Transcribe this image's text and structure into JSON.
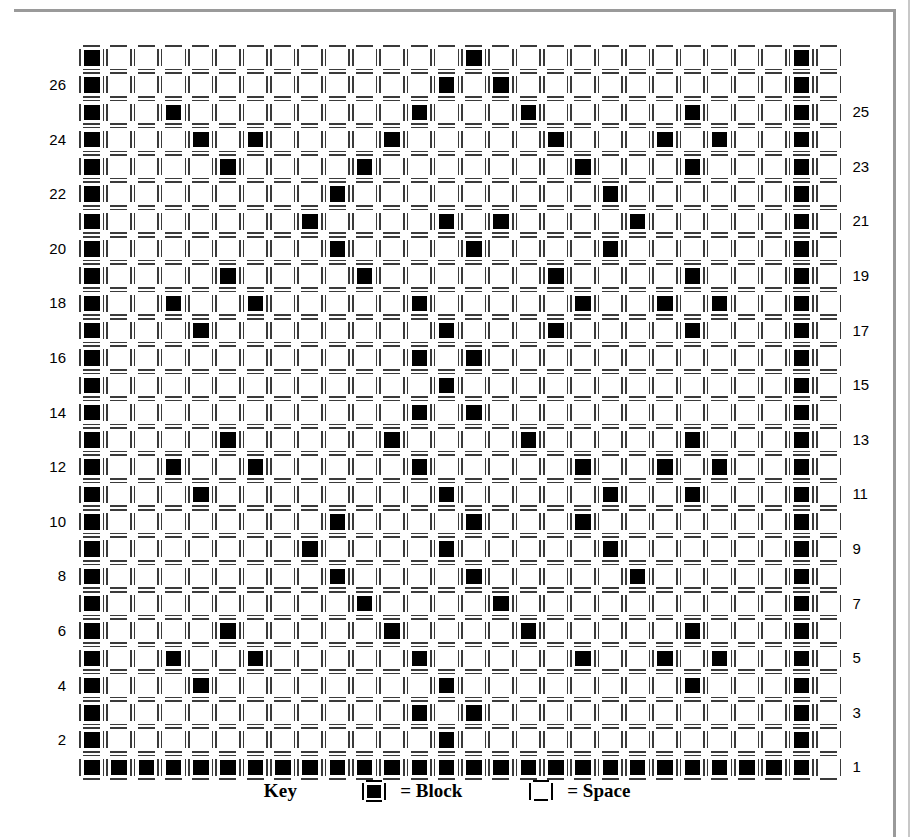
{
  "figure": {
    "type": "block-grid-pattern",
    "rows": 27,
    "cols": 28,
    "cell_glyph_block": "|■|",
    "cell_glyph_space": "|_|"
  },
  "axis": {
    "left_labels": [
      "26",
      "24",
      "22",
      "20",
      "18",
      "16",
      "14",
      "12",
      "10",
      "8",
      "6",
      "4",
      "2"
    ],
    "right_labels": [
      "25",
      "23",
      "21",
      "19",
      "17",
      "15",
      "13",
      "11",
      "9",
      "7",
      "5",
      "3",
      "1"
    ],
    "left_label_rows": [
      26,
      24,
      22,
      20,
      18,
      16,
      14,
      12,
      10,
      8,
      6,
      4,
      2
    ],
    "right_label_rows": [
      25,
      23,
      21,
      19,
      17,
      15,
      13,
      11,
      9,
      7,
      5,
      3,
      1
    ]
  },
  "key": {
    "title": "Key",
    "block_label": "= Block",
    "space_label": "= Space",
    "block_symbol": "block-cell",
    "space_symbol": "space-cell"
  },
  "colors": {
    "block": "#000000",
    "bracket": "#3a3a3a",
    "page_border": "#9a9a9a",
    "background": "#ffffff"
  },
  "chart_data": {
    "type": "heatmap",
    "title": "",
    "xlabel": "",
    "ylabel": "",
    "grid": true,
    "rows": 27,
    "cols": 28,
    "row_order_top_to_bottom": [
      27,
      26,
      25,
      24,
      23,
      22,
      21,
      20,
      19,
      18,
      17,
      16,
      15,
      14,
      13,
      12,
      11,
      10,
      9,
      8,
      7,
      6,
      5,
      4,
      3,
      2,
      1
    ],
    "legend": [
      "Block",
      "Space"
    ],
    "note": "Each matrix row is a list of 28 values: 1 = Block, 0 = Space. Row 1 (bottom) is fully filled.",
    "matrix": [
      [
        1,
        0,
        0,
        0,
        0,
        0,
        0,
        0,
        0,
        0,
        0,
        0,
        0,
        0,
        1,
        0,
        0,
        0,
        0,
        0,
        0,
        0,
        0,
        0,
        0,
        0,
        1,
        0
      ],
      [
        1,
        0,
        0,
        0,
        0,
        0,
        0,
        0,
        0,
        0,
        0,
        0,
        0,
        1,
        0,
        1,
        0,
        0,
        0,
        0,
        0,
        0,
        0,
        0,
        0,
        0,
        1,
        0
      ],
      [
        1,
        0,
        0,
        1,
        0,
        0,
        0,
        0,
        0,
        0,
        0,
        0,
        1,
        0,
        0,
        0,
        1,
        0,
        0,
        0,
        0,
        0,
        1,
        0,
        0,
        0,
        1,
        0
      ],
      [
        1,
        0,
        0,
        0,
        1,
        0,
        1,
        0,
        0,
        0,
        0,
        1,
        0,
        0,
        0,
        0,
        0,
        1,
        0,
        0,
        0,
        1,
        0,
        1,
        0,
        0,
        1,
        0
      ],
      [
        1,
        0,
        0,
        0,
        0,
        1,
        0,
        0,
        0,
        0,
        1,
        0,
        0,
        0,
        0,
        0,
        0,
        0,
        1,
        0,
        0,
        0,
        1,
        0,
        0,
        0,
        1,
        0
      ],
      [
        1,
        0,
        0,
        0,
        0,
        0,
        0,
        0,
        0,
        1,
        0,
        0,
        0,
        0,
        0,
        0,
        0,
        0,
        0,
        1,
        0,
        0,
        0,
        0,
        0,
        0,
        1,
        0
      ],
      [
        1,
        0,
        0,
        0,
        0,
        0,
        0,
        0,
        1,
        0,
        0,
        0,
        0,
        1,
        0,
        1,
        0,
        0,
        0,
        0,
        1,
        0,
        0,
        0,
        0,
        0,
        1,
        0
      ],
      [
        1,
        0,
        0,
        0,
        0,
        0,
        0,
        0,
        0,
        1,
        0,
        0,
        0,
        0,
        1,
        0,
        0,
        0,
        0,
        1,
        0,
        0,
        0,
        0,
        0,
        0,
        1,
        0
      ],
      [
        1,
        0,
        0,
        0,
        0,
        1,
        0,
        0,
        0,
        0,
        1,
        0,
        0,
        0,
        0,
        0,
        0,
        1,
        0,
        0,
        0,
        0,
        1,
        0,
        0,
        0,
        1,
        0
      ],
      [
        1,
        0,
        0,
        1,
        0,
        0,
        1,
        0,
        0,
        0,
        0,
        0,
        1,
        0,
        0,
        0,
        0,
        0,
        1,
        0,
        0,
        1,
        0,
        1,
        0,
        0,
        1,
        0
      ],
      [
        1,
        0,
        0,
        0,
        1,
        0,
        0,
        0,
        0,
        0,
        0,
        0,
        0,
        1,
        0,
        0,
        0,
        1,
        0,
        0,
        0,
        0,
        1,
        0,
        0,
        0,
        1,
        0
      ],
      [
        1,
        0,
        0,
        0,
        0,
        0,
        0,
        0,
        0,
        0,
        0,
        0,
        1,
        0,
        1,
        0,
        0,
        0,
        0,
        0,
        0,
        0,
        0,
        0,
        0,
        0,
        1,
        0
      ],
      [
        1,
        0,
        0,
        0,
        0,
        0,
        0,
        0,
        0,
        0,
        0,
        0,
        0,
        1,
        0,
        0,
        0,
        0,
        0,
        0,
        0,
        0,
        0,
        0,
        0,
        0,
        1,
        0
      ],
      [
        1,
        0,
        0,
        0,
        0,
        0,
        0,
        0,
        0,
        0,
        0,
        0,
        1,
        0,
        1,
        0,
        0,
        0,
        0,
        0,
        0,
        0,
        0,
        0,
        0,
        0,
        1,
        0
      ],
      [
        1,
        0,
        0,
        0,
        0,
        1,
        0,
        0,
        0,
        0,
        0,
        1,
        0,
        0,
        0,
        0,
        1,
        0,
        0,
        0,
        0,
        0,
        1,
        0,
        0,
        0,
        1,
        0
      ],
      [
        1,
        0,
        0,
        1,
        0,
        0,
        1,
        0,
        0,
        0,
        0,
        0,
        1,
        0,
        0,
        0,
        0,
        0,
        1,
        0,
        0,
        1,
        0,
        1,
        0,
        0,
        1,
        0
      ],
      [
        1,
        0,
        0,
        0,
        1,
        0,
        0,
        0,
        0,
        0,
        0,
        0,
        0,
        1,
        0,
        0,
        0,
        0,
        0,
        1,
        0,
        0,
        1,
        0,
        0,
        0,
        1,
        0
      ],
      [
        1,
        0,
        0,
        0,
        0,
        0,
        0,
        0,
        0,
        1,
        0,
        0,
        0,
        0,
        1,
        0,
        0,
        0,
        1,
        0,
        0,
        0,
        0,
        0,
        0,
        0,
        1,
        0
      ],
      [
        1,
        0,
        0,
        0,
        0,
        0,
        0,
        0,
        1,
        0,
        0,
        0,
        0,
        1,
        0,
        0,
        0,
        0,
        0,
        1,
        0,
        0,
        0,
        0,
        0,
        0,
        1,
        0
      ],
      [
        1,
        0,
        0,
        0,
        0,
        0,
        0,
        0,
        0,
        1,
        0,
        0,
        0,
        0,
        1,
        0,
        0,
        0,
        0,
        0,
        1,
        0,
        0,
        0,
        0,
        0,
        1,
        0
      ],
      [
        1,
        0,
        0,
        0,
        0,
        0,
        0,
        0,
        0,
        0,
        1,
        0,
        0,
        0,
        0,
        1,
        0,
        0,
        0,
        0,
        0,
        0,
        0,
        0,
        0,
        0,
        1,
        0
      ],
      [
        1,
        0,
        0,
        0,
        0,
        1,
        0,
        0,
        0,
        0,
        0,
        1,
        0,
        0,
        0,
        0,
        1,
        0,
        0,
        0,
        0,
        0,
        1,
        0,
        0,
        0,
        1,
        0
      ],
      [
        1,
        0,
        0,
        1,
        0,
        0,
        1,
        0,
        0,
        0,
        0,
        0,
        1,
        0,
        0,
        0,
        0,
        0,
        1,
        0,
        0,
        1,
        0,
        1,
        0,
        0,
        1,
        0
      ],
      [
        1,
        0,
        0,
        0,
        1,
        0,
        0,
        0,
        0,
        0,
        0,
        0,
        0,
        1,
        0,
        0,
        0,
        0,
        0,
        0,
        0,
        0,
        1,
        0,
        0,
        0,
        1,
        0
      ],
      [
        1,
        0,
        0,
        0,
        0,
        0,
        0,
        0,
        0,
        0,
        0,
        0,
        1,
        0,
        1,
        0,
        0,
        0,
        0,
        0,
        0,
        0,
        0,
        0,
        0,
        0,
        1,
        0
      ],
      [
        1,
        0,
        0,
        0,
        0,
        0,
        0,
        0,
        0,
        0,
        0,
        0,
        0,
        1,
        0,
        0,
        0,
        0,
        0,
        0,
        0,
        0,
        0,
        0,
        0,
        0,
        1,
        0
      ],
      [
        1,
        1,
        1,
        1,
        1,
        1,
        1,
        1,
        1,
        1,
        1,
        1,
        1,
        1,
        1,
        1,
        1,
        1,
        1,
        1,
        1,
        1,
        1,
        1,
        1,
        1,
        1,
        0
      ]
    ]
  }
}
